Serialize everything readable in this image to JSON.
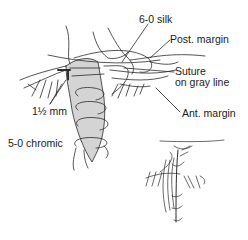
{
  "diagram": {
    "type": "surgical-illustration",
    "labels": {
      "silk": "6-0 silk",
      "post_margin": "Post. margin",
      "suture_gray_line": "Suture\non gray line",
      "measurement": "1½ mm",
      "ant_margin": "Ant. margin",
      "chromic": "5-0 chromic"
    },
    "colors": {
      "line": "#2a2a2a",
      "tarsus_fill": "#d4d4d4",
      "background": "#ffffff"
    }
  }
}
